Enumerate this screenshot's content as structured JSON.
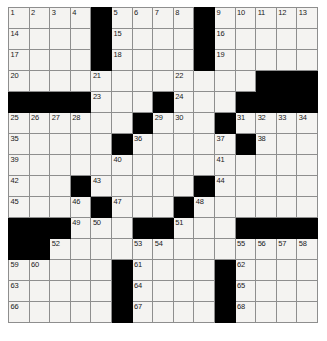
{
  "puzzle": {
    "type": "crossword-grid",
    "rows": 15,
    "columns": 15,
    "colors": {
      "block": "#000000",
      "cell": "#f4f3f1",
      "grid_line": "#8e8e8e",
      "border": "#4a4a4a",
      "number_text": "#1a1a1a"
    },
    "grid": [
      [
        {
          "block": false,
          "number": "1"
        },
        {
          "block": false,
          "number": "2"
        },
        {
          "block": false,
          "number": "3"
        },
        {
          "block": false,
          "number": "4"
        },
        {
          "block": true,
          "number": ""
        },
        {
          "block": false,
          "number": "5"
        },
        {
          "block": false,
          "number": "6"
        },
        {
          "block": false,
          "number": "7"
        },
        {
          "block": false,
          "number": "8"
        },
        {
          "block": true,
          "number": ""
        },
        {
          "block": false,
          "number": "9"
        },
        {
          "block": false,
          "number": "10"
        },
        {
          "block": false,
          "number": "11"
        },
        {
          "block": false,
          "number": "12"
        },
        {
          "block": false,
          "number": "13"
        }
      ],
      [
        {
          "block": false,
          "number": "14"
        },
        {
          "block": false,
          "number": ""
        },
        {
          "block": false,
          "number": ""
        },
        {
          "block": false,
          "number": ""
        },
        {
          "block": true,
          "number": ""
        },
        {
          "block": false,
          "number": "15"
        },
        {
          "block": false,
          "number": ""
        },
        {
          "block": false,
          "number": ""
        },
        {
          "block": false,
          "number": ""
        },
        {
          "block": true,
          "number": ""
        },
        {
          "block": false,
          "number": "16"
        },
        {
          "block": false,
          "number": ""
        },
        {
          "block": false,
          "number": ""
        },
        {
          "block": false,
          "number": ""
        },
        {
          "block": false,
          "number": ""
        }
      ],
      [
        {
          "block": false,
          "number": "17"
        },
        {
          "block": false,
          "number": ""
        },
        {
          "block": false,
          "number": ""
        },
        {
          "block": false,
          "number": ""
        },
        {
          "block": true,
          "number": ""
        },
        {
          "block": false,
          "number": "18"
        },
        {
          "block": false,
          "number": ""
        },
        {
          "block": false,
          "number": ""
        },
        {
          "block": false,
          "number": ""
        },
        {
          "block": true,
          "number": ""
        },
        {
          "block": false,
          "number": "19"
        },
        {
          "block": false,
          "number": ""
        },
        {
          "block": false,
          "number": ""
        },
        {
          "block": false,
          "number": ""
        },
        {
          "block": false,
          "number": ""
        }
      ],
      [
        {
          "block": false,
          "number": "20"
        },
        {
          "block": false,
          "number": ""
        },
        {
          "block": false,
          "number": ""
        },
        {
          "block": false,
          "number": ""
        },
        {
          "block": false,
          "number": "21"
        },
        {
          "block": false,
          "number": ""
        },
        {
          "block": false,
          "number": ""
        },
        {
          "block": false,
          "number": ""
        },
        {
          "block": false,
          "number": "22"
        },
        {
          "block": false,
          "number": ""
        },
        {
          "block": false,
          "number": ""
        },
        {
          "block": false,
          "number": ""
        },
        {
          "block": true,
          "number": ""
        },
        {
          "block": true,
          "number": ""
        },
        {
          "block": true,
          "number": ""
        }
      ],
      [
        {
          "block": true,
          "number": ""
        },
        {
          "block": true,
          "number": ""
        },
        {
          "block": true,
          "number": ""
        },
        {
          "block": true,
          "number": ""
        },
        {
          "block": false,
          "number": "23"
        },
        {
          "block": false,
          "number": ""
        },
        {
          "block": false,
          "number": ""
        },
        {
          "block": true,
          "number": ""
        },
        {
          "block": false,
          "number": "24"
        },
        {
          "block": false,
          "number": ""
        },
        {
          "block": false,
          "number": ""
        },
        {
          "block": true,
          "number": ""
        },
        {
          "block": true,
          "number": ""
        },
        {
          "block": true,
          "number": ""
        },
        {
          "block": true,
          "number": ""
        }
      ],
      [
        {
          "block": false,
          "number": "25"
        },
        {
          "block": false,
          "number": "26"
        },
        {
          "block": false,
          "number": "27"
        },
        {
          "block": false,
          "number": "28"
        },
        {
          "block": false,
          "number": ""
        },
        {
          "block": false,
          "number": ""
        },
        {
          "block": true,
          "number": ""
        },
        {
          "block": false,
          "number": "29"
        },
        {
          "block": false,
          "number": "30"
        },
        {
          "block": false,
          "number": ""
        },
        {
          "block": true,
          "number": ""
        },
        {
          "block": false,
          "number": "31"
        },
        {
          "block": false,
          "number": "32"
        },
        {
          "block": false,
          "number": "33"
        },
        {
          "block": false,
          "number": "34"
        }
      ],
      [
        {
          "block": false,
          "number": "35"
        },
        {
          "block": false,
          "number": ""
        },
        {
          "block": false,
          "number": ""
        },
        {
          "block": false,
          "number": ""
        },
        {
          "block": false,
          "number": ""
        },
        {
          "block": true,
          "number": ""
        },
        {
          "block": false,
          "number": "36"
        },
        {
          "block": false,
          "number": ""
        },
        {
          "block": false,
          "number": ""
        },
        {
          "block": false,
          "number": ""
        },
        {
          "block": false,
          "number": "37"
        },
        {
          "block": true,
          "number": ""
        },
        {
          "block": false,
          "number": "38"
        },
        {
          "block": false,
          "number": ""
        },
        {
          "block": false,
          "number": ""
        }
      ],
      [
        {
          "block": false,
          "number": "39"
        },
        {
          "block": false,
          "number": ""
        },
        {
          "block": false,
          "number": ""
        },
        {
          "block": false,
          "number": ""
        },
        {
          "block": false,
          "number": ""
        },
        {
          "block": false,
          "number": "40"
        },
        {
          "block": false,
          "number": ""
        },
        {
          "block": false,
          "number": ""
        },
        {
          "block": false,
          "number": ""
        },
        {
          "block": false,
          "number": ""
        },
        {
          "block": false,
          "number": "41"
        },
        {
          "block": false,
          "number": ""
        },
        {
          "block": false,
          "number": ""
        },
        {
          "block": false,
          "number": ""
        },
        {
          "block": false,
          "number": ""
        }
      ],
      [
        {
          "block": false,
          "number": "42"
        },
        {
          "block": false,
          "number": ""
        },
        {
          "block": false,
          "number": ""
        },
        {
          "block": true,
          "number": ""
        },
        {
          "block": false,
          "number": "43"
        },
        {
          "block": false,
          "number": ""
        },
        {
          "block": false,
          "number": ""
        },
        {
          "block": false,
          "number": ""
        },
        {
          "block": false,
          "number": ""
        },
        {
          "block": true,
          "number": ""
        },
        {
          "block": false,
          "number": "44"
        },
        {
          "block": false,
          "number": ""
        },
        {
          "block": false,
          "number": ""
        },
        {
          "block": false,
          "number": ""
        },
        {
          "block": false,
          "number": ""
        }
      ],
      [
        {
          "block": false,
          "number": "45"
        },
        {
          "block": false,
          "number": ""
        },
        {
          "block": false,
          "number": ""
        },
        {
          "block": false,
          "number": "46"
        },
        {
          "block": true,
          "number": ""
        },
        {
          "block": false,
          "number": "47"
        },
        {
          "block": false,
          "number": ""
        },
        {
          "block": false,
          "number": ""
        },
        {
          "block": true,
          "number": ""
        },
        {
          "block": false,
          "number": "48"
        },
        {
          "block": false,
          "number": ""
        },
        {
          "block": false,
          "number": ""
        },
        {
          "block": false,
          "number": ""
        },
        {
          "block": false,
          "number": ""
        },
        {
          "block": false,
          "number": ""
        }
      ],
      [
        {
          "block": true,
          "number": ""
        },
        {
          "block": true,
          "number": ""
        },
        {
          "block": true,
          "number": ""
        },
        {
          "block": false,
          "number": "49"
        },
        {
          "block": false,
          "number": "50"
        },
        {
          "block": false,
          "number": ""
        },
        {
          "block": true,
          "number": ""
        },
        {
          "block": true,
          "number": ""
        },
        {
          "block": false,
          "number": "51"
        },
        {
          "block": false,
          "number": ""
        },
        {
          "block": false,
          "number": ""
        },
        {
          "block": true,
          "number": ""
        },
        {
          "block": true,
          "number": ""
        },
        {
          "block": true,
          "number": ""
        },
        {
          "block": true,
          "number": ""
        }
      ],
      [
        {
          "block": true,
          "number": ""
        },
        {
          "block": true,
          "number": ""
        },
        {
          "block": false,
          "number": "52"
        },
        {
          "block": false,
          "number": ""
        },
        {
          "block": false,
          "number": ""
        },
        {
          "block": false,
          "number": ""
        },
        {
          "block": false,
          "number": "53"
        },
        {
          "block": false,
          "number": "54"
        },
        {
          "block": false,
          "number": ""
        },
        {
          "block": false,
          "number": ""
        },
        {
          "block": false,
          "number": ""
        },
        {
          "block": false,
          "number": "55"
        },
        {
          "block": false,
          "number": "56"
        },
        {
          "block": false,
          "number": "57"
        },
        {
          "block": false,
          "number": "58"
        }
      ],
      [
        {
          "block": false,
          "number": "59"
        },
        {
          "block": false,
          "number": "60"
        },
        {
          "block": false,
          "number": ""
        },
        {
          "block": false,
          "number": ""
        },
        {
          "block": false,
          "number": ""
        },
        {
          "block": true,
          "number": ""
        },
        {
          "block": false,
          "number": "61"
        },
        {
          "block": false,
          "number": ""
        },
        {
          "block": false,
          "number": ""
        },
        {
          "block": false,
          "number": ""
        },
        {
          "block": true,
          "number": ""
        },
        {
          "block": false,
          "number": "62"
        },
        {
          "block": false,
          "number": ""
        },
        {
          "block": false,
          "number": ""
        },
        {
          "block": false,
          "number": ""
        }
      ],
      [
        {
          "block": false,
          "number": "63"
        },
        {
          "block": false,
          "number": ""
        },
        {
          "block": false,
          "number": ""
        },
        {
          "block": false,
          "number": ""
        },
        {
          "block": false,
          "number": ""
        },
        {
          "block": true,
          "number": ""
        },
        {
          "block": false,
          "number": "64"
        },
        {
          "block": false,
          "number": ""
        },
        {
          "block": false,
          "number": ""
        },
        {
          "block": false,
          "number": ""
        },
        {
          "block": true,
          "number": ""
        },
        {
          "block": false,
          "number": "65"
        },
        {
          "block": false,
          "number": ""
        },
        {
          "block": false,
          "number": ""
        },
        {
          "block": false,
          "number": ""
        }
      ],
      [
        {
          "block": false,
          "number": "66"
        },
        {
          "block": false,
          "number": ""
        },
        {
          "block": false,
          "number": ""
        },
        {
          "block": false,
          "number": ""
        },
        {
          "block": false,
          "number": ""
        },
        {
          "block": true,
          "number": ""
        },
        {
          "block": false,
          "number": "67"
        },
        {
          "block": false,
          "number": ""
        },
        {
          "block": false,
          "number": ""
        },
        {
          "block": false,
          "number": ""
        },
        {
          "block": true,
          "number": ""
        },
        {
          "block": false,
          "number": "68"
        },
        {
          "block": false,
          "number": ""
        },
        {
          "block": false,
          "number": ""
        },
        {
          "block": false,
          "number": ""
        }
      ]
    ]
  }
}
